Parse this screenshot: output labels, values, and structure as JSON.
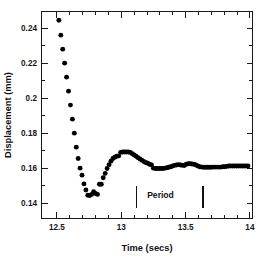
{
  "chart_data": {
    "type": "scatter",
    "title": "",
    "xlabel": "Time  (secs)",
    "ylabel": "Displacement  (mm)",
    "xlim": [
      12.38,
      14.02
    ],
    "ylim": [
      0.1315,
      0.2495
    ],
    "xticks_major": [
      12.5,
      13,
      13.5,
      14
    ],
    "xticklabels": [
      "12.5",
      "13",
      "13.5",
      "14"
    ],
    "xticks_minor": [
      12.6,
      12.7,
      12.8,
      12.9,
      13.1,
      13.2,
      13.3,
      13.4,
      13.6,
      13.7,
      13.8,
      13.9
    ],
    "yticks_major": [
      0.24,
      0.22,
      0.2,
      0.18,
      0.16,
      0.14
    ],
    "yticklabels": [
      "0.24",
      "0.22",
      "0.2",
      "0.18",
      "0.16",
      "0.14"
    ],
    "yticks_minor": [
      0.25,
      0.23,
      0.21,
      0.19,
      0.17,
      0.15,
      0.13
    ],
    "grid": false,
    "legend": false,
    "marker": "filled-circle",
    "marker_color": "#000000",
    "series": [
      {
        "name": "displacement",
        "x": [
          12.515,
          12.53,
          12.545,
          12.56,
          12.575,
          12.59,
          12.605,
          12.62,
          12.635,
          12.65,
          12.665,
          12.68,
          12.695,
          12.71,
          12.725,
          12.74,
          12.755,
          12.77,
          12.785,
          12.8,
          12.815,
          12.83,
          12.845,
          12.86,
          12.875,
          12.89,
          12.905,
          12.92,
          12.935,
          12.95,
          12.965,
          12.98,
          12.995,
          13.01,
          13.025,
          13.04,
          13.055,
          13.07,
          13.085,
          13.1,
          13.115,
          13.13,
          13.145,
          13.16,
          13.175,
          13.19,
          13.205,
          13.22,
          13.235,
          13.25,
          13.265,
          13.28,
          13.295,
          13.31,
          13.325,
          13.34,
          13.355,
          13.37,
          13.385,
          13.4,
          13.415,
          13.43,
          13.445,
          13.46,
          13.475,
          13.49,
          13.505,
          13.52,
          13.535,
          13.55,
          13.565,
          13.58,
          13.595,
          13.61,
          13.625,
          13.64,
          13.655,
          13.67,
          13.685,
          13.7,
          13.715,
          13.73,
          13.745,
          13.76,
          13.775,
          13.79,
          13.805,
          13.82,
          13.835,
          13.85,
          13.865,
          13.88,
          13.895,
          13.91,
          13.925,
          13.94,
          13.955,
          13.97,
          13.985
        ],
        "y": [
          0.2445,
          0.236,
          0.228,
          0.22,
          0.212,
          0.204,
          0.196,
          0.188,
          0.18,
          0.172,
          0.1655,
          0.16,
          0.156,
          0.151,
          0.1475,
          0.1445,
          0.1443,
          0.145,
          0.1465,
          0.1455,
          0.145,
          0.1508,
          0.1508,
          0.1545,
          0.157,
          0.1598,
          0.162,
          0.164,
          0.1655,
          0.1662,
          0.1668,
          0.167,
          0.169,
          0.1692,
          0.1692,
          0.1692,
          0.1692,
          0.169,
          0.1682,
          0.1675,
          0.1668,
          0.166,
          0.1652,
          0.1645,
          0.1638,
          0.1632,
          0.1628,
          0.1622,
          0.1618,
          0.16,
          0.1598,
          0.1598,
          0.1598,
          0.1598,
          0.1598,
          0.16,
          0.1602,
          0.1605,
          0.1608,
          0.1612,
          0.1616,
          0.1618,
          0.162,
          0.1618,
          0.1616,
          0.1615,
          0.1622,
          0.1625,
          0.1625,
          0.1624,
          0.1622,
          0.1618,
          0.1612,
          0.1608,
          0.1606,
          0.1605,
          0.1605,
          0.1605,
          0.1605,
          0.1605,
          0.1606,
          0.1606,
          0.1606,
          0.1606,
          0.1606,
          0.1608,
          0.1608,
          0.161,
          0.1612,
          0.1612,
          0.1612,
          0.1612,
          0.1612,
          0.1612,
          0.1612,
          0.1612,
          0.1612,
          0.1612,
          0.1612
        ]
      }
    ],
    "annotations": {
      "period": {
        "label": "Period",
        "label_x": 13.305,
        "label_y": 0.1428,
        "marker_left_x": 13.118,
        "marker_right_x": 13.635,
        "marker_top_y": 0.15,
        "marker_bottom_y": 0.1372
      }
    }
  }
}
